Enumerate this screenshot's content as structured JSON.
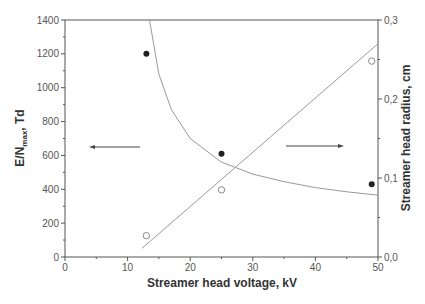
{
  "chart_data": {
    "type": "scatter",
    "title": "",
    "xlabel": "Streamer head voltage, kV",
    "ylabel": "E/N_max, Td",
    "ylabel_main": "E/N",
    "ylabel_sub": "max",
    "ylabel_suffix": ", Td",
    "y2label": "Streamer head radius, cm",
    "xlim": [
      0,
      50
    ],
    "ylim": [
      0,
      1400
    ],
    "y2lim": [
      0.0,
      0.3
    ],
    "x_ticks": [
      "0",
      "10",
      "20",
      "30",
      "40",
      "50"
    ],
    "y_ticks": [
      "0",
      "200",
      "400",
      "600",
      "800",
      "1000",
      "1200",
      "1400"
    ],
    "y2_ticks": [
      "0,0",
      "0,1",
      "0,2",
      "0,3"
    ],
    "grid": false,
    "legend": "none",
    "series": [
      {
        "name": "E/N_max (filled circles)",
        "axis": "left",
        "marker": "filled-circle",
        "x": [
          13,
          25,
          49
        ],
        "values": [
          1200,
          610,
          430
        ]
      },
      {
        "name": "Streamer head radius (open circles)",
        "axis": "right",
        "marker": "open-circle",
        "x": [
          13,
          25,
          49
        ],
        "values": [
          0.027,
          0.085,
          0.248
        ]
      },
      {
        "name": "E/N_max fit curve",
        "axis": "left",
        "style": "line",
        "x": [
          13.5,
          15,
          17,
          20,
          25,
          30,
          35,
          40,
          45,
          50
        ],
        "values": [
          1400,
          1080,
          870,
          700,
          560,
          490,
          445,
          410,
          385,
          365
        ]
      },
      {
        "name": "Radius fit line",
        "axis": "right",
        "style": "line",
        "x": [
          12.3,
          50
        ],
        "values": [
          0.011,
          0.27
        ]
      }
    ],
    "annotations": [
      {
        "type": "arrow",
        "direction": "left",
        "refers_to": "left axis"
      },
      {
        "type": "arrow",
        "direction": "right",
        "refers_to": "right axis"
      }
    ]
  }
}
